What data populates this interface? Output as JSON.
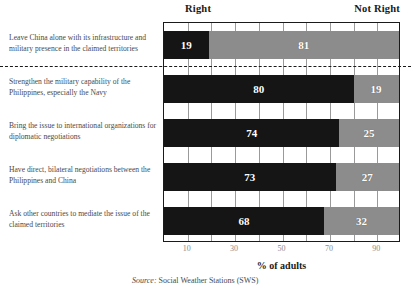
{
  "header": {
    "right_label": "Right",
    "not_right_label": "Not Right"
  },
  "axis": {
    "title": "% of adults",
    "tick_labels": [
      "10",
      "30",
      "50",
      "70",
      "90"
    ]
  },
  "source": {
    "prefix": "Source:",
    "text": " Social Weather Stations (SWS)"
  },
  "colors": {
    "right": "#151515",
    "not_right": "#8c8c8c",
    "plot_border": "#1a1a1a",
    "gridline": "#9a9a9a",
    "label_text": "#4a4a4a",
    "tick_text": "#8a8a8a"
  },
  "chart_data": {
    "type": "bar",
    "orientation": "horizontal",
    "stacked": true,
    "title": "",
    "xlabel": "% of adults",
    "ylabel": "",
    "xlim": [
      0,
      100
    ],
    "xticks": [
      10,
      30,
      50,
      70,
      90
    ],
    "grid": true,
    "gridline_interval": 10,
    "legend_position": "top",
    "categories": [
      "Leave China alone with its infrastructure and military presence in the claimed territories",
      "Strengthen the military capability of the Philippines, especially the Navy",
      "Bring the issue to international organizations for diplomatic negotiations",
      "Have direct, bilateral negotiations between the Philippines and China",
      "Ask other countries to mediate the issue of the claimed territories"
    ],
    "series": [
      {
        "name": "Right",
        "values": [
          19,
          80,
          74,
          73,
          68
        ]
      },
      {
        "name": "Not Right",
        "values": [
          81,
          19,
          25,
          27,
          32
        ]
      }
    ],
    "separator_after_category_index": 0
  }
}
